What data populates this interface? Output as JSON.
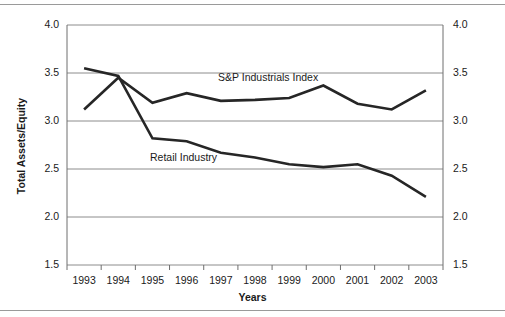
{
  "chart_data": {
    "type": "line",
    "title": "",
    "xlabel": "Years",
    "ylabel": "Total Assets/Equity",
    "x": [
      "1993",
      "1994",
      "1995",
      "1996",
      "1997",
      "1998",
      "1999",
      "2000",
      "2001",
      "2002",
      "2003"
    ],
    "ylim": [
      1.5,
      4.0
    ],
    "yticks": [
      "1.5",
      "2.0",
      "2.5",
      "3.0",
      "3.5",
      "4.0"
    ],
    "ytick_values": [
      1.5,
      2.0,
      2.5,
      3.0,
      3.5,
      4.0
    ],
    "right_axis_yticks": [
      "1.5",
      "2.0",
      "2.5",
      "3.0",
      "3.5",
      "4.0"
    ],
    "grid": true,
    "grid_axis": "y",
    "legend_position": "inline-annotation",
    "series": [
      {
        "name": "S&P Industrials Index",
        "color": "#262626",
        "values": [
          3.12,
          3.45,
          3.19,
          3.29,
          3.21,
          3.22,
          3.24,
          3.37,
          3.18,
          3.12,
          3.32
        ]
      },
      {
        "name": "Retail Industry",
        "color": "#262626",
        "values": [
          3.55,
          3.47,
          2.82,
          2.79,
          2.67,
          2.62,
          2.55,
          2.52,
          2.55,
          2.43,
          2.21
        ]
      }
    ],
    "annotations": [
      {
        "text": "S&P Industrials Index",
        "series": "S&P Industrials Index"
      },
      {
        "text": "Retail Industry",
        "series": "Retail Industry"
      }
    ]
  },
  "axes": {
    "left_label": "Total Assets/Equity",
    "bottom_label": "Years"
  },
  "colors": {
    "line": "#262626",
    "grid": "#8c8c8c",
    "frame": "#6e6e6e",
    "rule": "#9a9a9a",
    "background": "#ffffff"
  }
}
